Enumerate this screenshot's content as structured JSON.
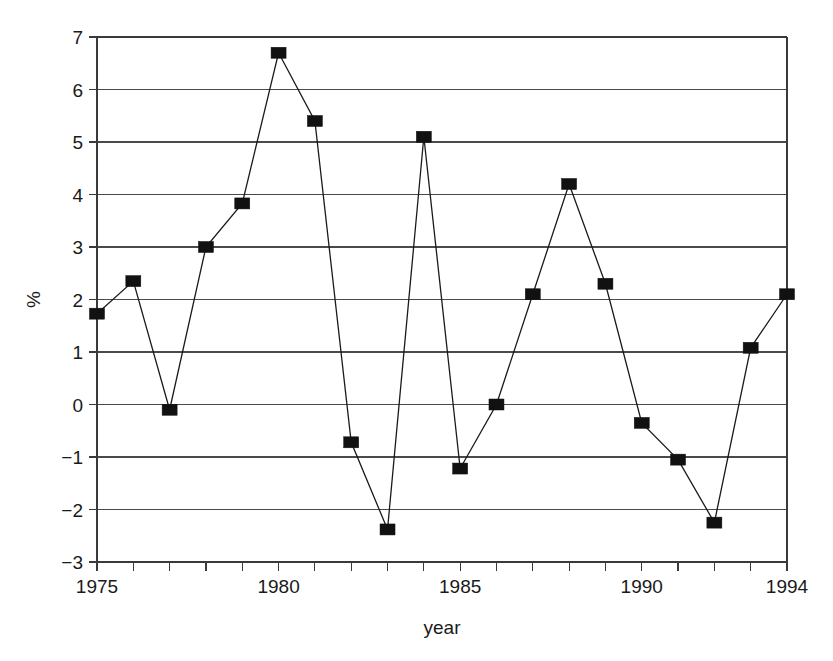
{
  "chart_data": {
    "type": "line",
    "title": "",
    "subtitle": "",
    "xlabel": "year",
    "ylabel": "%",
    "xlim": [
      1975,
      1994
    ],
    "ylim": [
      -3,
      7
    ],
    "grid": "horizontal",
    "legend": "none",
    "marker": "filled-square",
    "x": [
      1975,
      1976,
      1977,
      1978,
      1979,
      1980,
      1981,
      1982,
      1983,
      1984,
      1985,
      1986,
      1987,
      1988,
      1989,
      1990,
      1991,
      1992,
      1993,
      1994
    ],
    "values": [
      1.73,
      2.35,
      -0.1,
      3.0,
      3.83,
      6.7,
      5.4,
      -0.72,
      -2.38,
      5.1,
      -1.22,
      0.0,
      2.1,
      4.2,
      2.3,
      -0.35,
      -1.05,
      -2.25,
      1.08,
      2.1
    ],
    "x_ticks_all": [
      1975,
      1976,
      1977,
      1978,
      1979,
      1980,
      1981,
      1982,
      1983,
      1984,
      1985,
      1986,
      1987,
      1988,
      1989,
      1990,
      1991,
      1992,
      1993,
      1994
    ],
    "x_tick_labels": [
      {
        "value": 1975,
        "label": "1975"
      },
      {
        "value": 1980,
        "label": "1980"
      },
      {
        "value": 1985,
        "label": "1985"
      },
      {
        "value": 1990,
        "label": "1990"
      },
      {
        "value": 1994,
        "label": "1994"
      }
    ],
    "y_ticks": [
      -3,
      -2,
      -1,
      0,
      1,
      2,
      3,
      4,
      5,
      6,
      7
    ],
    "y_tick_labels": [
      "−3",
      "−2",
      "−1",
      "0",
      "1",
      "2",
      "3",
      "4",
      "5",
      "6",
      "7"
    ],
    "colors": {
      "line": "#1a1a1a",
      "marker": "#111111",
      "grid": "#4a4a4a",
      "axis": "#3a3a3a",
      "background": "#ffffff",
      "text": "#1a1a1a"
    },
    "plot_area": {
      "left": 97,
      "right": 787,
      "top": 37,
      "bottom": 562
    }
  }
}
